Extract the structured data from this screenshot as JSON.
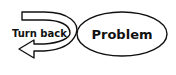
{
  "diagram": {
    "nodes": [
      {
        "id": "problem",
        "shape": "ellipse",
        "label": "Problem"
      }
    ],
    "arrows": [
      {
        "id": "turn-back",
        "shape": "u-turn-arrow",
        "label": "Turn back",
        "direction": "left"
      }
    ],
    "colors": {
      "stroke": "#111111",
      "fill": "#ffffff"
    }
  }
}
